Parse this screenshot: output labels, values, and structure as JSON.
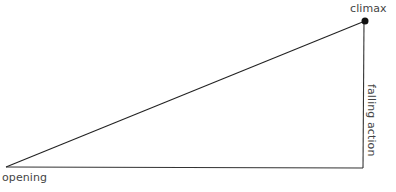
{
  "diagram": {
    "type": "plot-structure-triangle",
    "points": {
      "opening": {
        "x": 6,
        "y": 167
      },
      "climax": {
        "x": 365,
        "y": 21
      },
      "end": {
        "x": 363,
        "y": 168
      }
    },
    "labels": {
      "climax": "climax",
      "opening": "opening",
      "falling_action": "falling action"
    },
    "colors": {
      "line": "#222222",
      "dot": "#111111",
      "text": "#444444"
    }
  }
}
